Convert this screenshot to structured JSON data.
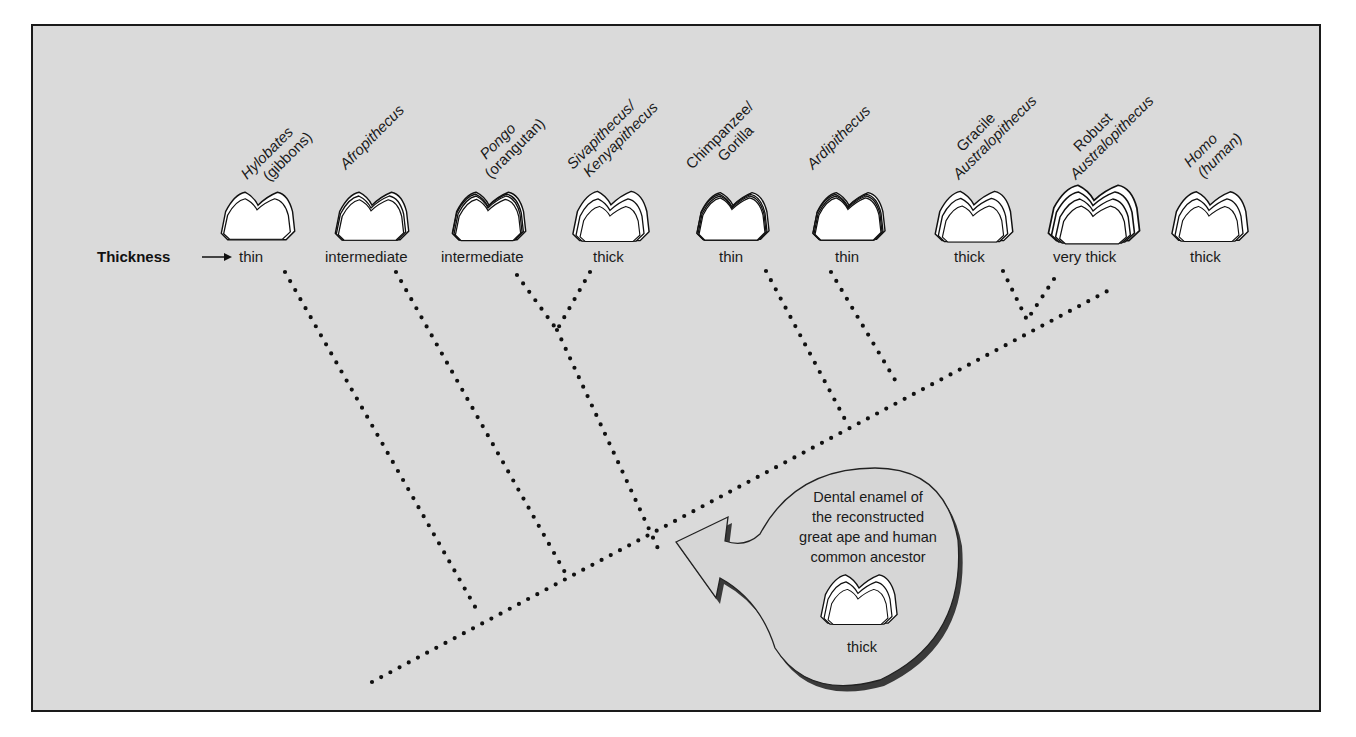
{
  "diagram": {
    "row_label": "Thickness",
    "row_arrow": "right-arrow",
    "taxa": [
      {
        "name_line1": "Hylobates",
        "name_line2": "(gibbons)",
        "thickness": "thin",
        "enamel_layers": 2
      },
      {
        "name_line1": "Afropithecus",
        "name_line2": "",
        "thickness": "intermediate",
        "enamel_layers": 3
      },
      {
        "name_line1": "Pongo",
        "name_line2": "(orangutan)",
        "thickness": "intermediate",
        "enamel_layers": 4
      },
      {
        "name_line1": "Sivapithecus/",
        "name_line2": "Kenyapithecus",
        "thickness": "thick",
        "enamel_layers": 3
      },
      {
        "name_line1": "Chimpanzee/",
        "name_line2": "Gorilla",
        "thickness": "thin",
        "enamel_layers": 4
      },
      {
        "name_line1": "Ardipithecus",
        "name_line2": "",
        "thickness": "thin",
        "enamel_layers": 4
      },
      {
        "name_line1": "Gracile",
        "name_line2": "Australopithecus",
        "thickness": "thick",
        "enamel_layers": 3
      },
      {
        "name_line1": "Robust",
        "name_line2": "Australopithecus",
        "thickness": "very thick",
        "enamel_layers": 4
      },
      {
        "name_line1": "Homo",
        "name_line2": "(human)",
        "thickness": "thick",
        "enamel_layers": 3
      }
    ],
    "callout": {
      "lines": [
        "Dental enamel of",
        "the reconstructed",
        "great ape and human",
        "common ancestor"
      ],
      "thickness": "thick"
    },
    "colors": {
      "background": "#dadada",
      "frame": "#1a1a1a",
      "tooth_fill": "#ffffff",
      "callout_fill": "#d6d6d6",
      "callout_shadow": "#3a3a3a"
    }
  }
}
